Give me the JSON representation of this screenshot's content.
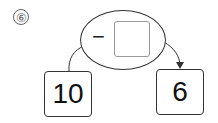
{
  "problem_number": "⑥",
  "operation": {
    "operator": "−",
    "answer_blank": ""
  },
  "start_value": "10",
  "result_value": "6"
}
